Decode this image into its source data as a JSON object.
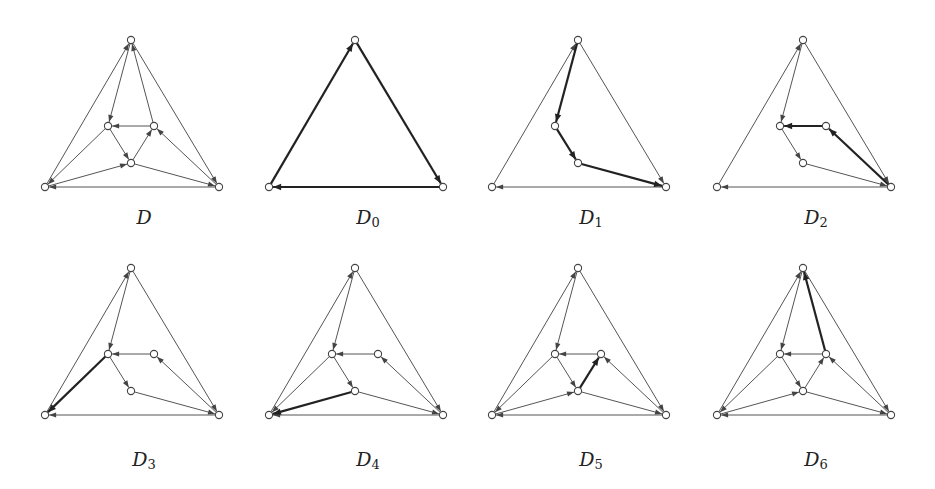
{
  "figure": {
    "nodes": {
      "T": [
        98,
        10
      ],
      "BL": [
        12,
        157
      ],
      "BR": [
        186,
        157
      ],
      "IL": [
        75,
        96
      ],
      "IR": [
        121,
        96
      ],
      "IB": [
        98,
        133
      ]
    },
    "panels": [
      {
        "id": "D",
        "label": "D",
        "subscript": "",
        "x": 33,
        "y": 30,
        "visible_nodes": [
          "T",
          "BL",
          "BR",
          "IL",
          "IR",
          "IB"
        ],
        "edges": [
          {
            "from": "BL",
            "to": "T",
            "thick": false
          },
          {
            "from": "T",
            "to": "BR",
            "thick": false
          },
          {
            "from": "BR",
            "to": "BL",
            "thick": false
          },
          {
            "from": "T",
            "to": "IL",
            "thick": false
          },
          {
            "from": "IR",
            "to": "T",
            "thick": false
          },
          {
            "from": "IR",
            "to": "IL",
            "thick": false
          },
          {
            "from": "IL",
            "to": "IB",
            "thick": false
          },
          {
            "from": "IB",
            "to": "IR",
            "thick": false
          },
          {
            "from": "IL",
            "to": "BL",
            "thick": false
          },
          {
            "from": "BL",
            "to": "IB",
            "thick": false
          },
          {
            "from": "IB",
            "to": "BR",
            "thick": false
          },
          {
            "from": "BR",
            "to": "IR",
            "thick": false
          }
        ]
      },
      {
        "id": "D0",
        "label": "D",
        "subscript": "0",
        "x": 257,
        "y": 30,
        "visible_nodes": [
          "T",
          "BL",
          "BR"
        ],
        "edges": [
          {
            "from": "BL",
            "to": "T",
            "thick": true
          },
          {
            "from": "T",
            "to": "BR",
            "thick": true
          },
          {
            "from": "BR",
            "to": "BL",
            "thick": true
          }
        ]
      },
      {
        "id": "D1",
        "label": "D",
        "subscript": "1",
        "x": 480,
        "y": 30,
        "visible_nodes": [
          "T",
          "BL",
          "BR",
          "IL",
          "IB"
        ],
        "edges": [
          {
            "from": "BL",
            "to": "T",
            "thick": false
          },
          {
            "from": "T",
            "to": "BR",
            "thick": false
          },
          {
            "from": "BR",
            "to": "BL",
            "thick": false
          },
          {
            "from": "T",
            "to": "IL",
            "thick": true
          },
          {
            "from": "IL",
            "to": "IB",
            "thick": true
          },
          {
            "from": "IB",
            "to": "BR",
            "thick": true
          }
        ]
      },
      {
        "id": "D2",
        "label": "D",
        "subscript": "2",
        "x": 705,
        "y": 30,
        "visible_nodes": [
          "T",
          "BL",
          "BR",
          "IL",
          "IR",
          "IB"
        ],
        "edges": [
          {
            "from": "BL",
            "to": "T",
            "thick": false
          },
          {
            "from": "T",
            "to": "BR",
            "thick": false
          },
          {
            "from": "BR",
            "to": "BL",
            "thick": false
          },
          {
            "from": "T",
            "to": "IL",
            "thick": false
          },
          {
            "from": "IL",
            "to": "IB",
            "thick": false
          },
          {
            "from": "IB",
            "to": "BR",
            "thick": false
          },
          {
            "from": "IR",
            "to": "IL",
            "thick": true
          },
          {
            "from": "BR",
            "to": "IR",
            "thick": true
          }
        ]
      },
      {
        "id": "D3",
        "label": "D",
        "subscript": "3",
        "x": 33,
        "y": 258,
        "visible_nodes": [
          "T",
          "BL",
          "BR",
          "IL",
          "IR",
          "IB"
        ],
        "edges": [
          {
            "from": "BL",
            "to": "T",
            "thick": false
          },
          {
            "from": "T",
            "to": "BR",
            "thick": false
          },
          {
            "from": "BR",
            "to": "BL",
            "thick": false
          },
          {
            "from": "T",
            "to": "IL",
            "thick": false
          },
          {
            "from": "IR",
            "to": "IL",
            "thick": false
          },
          {
            "from": "BR",
            "to": "IR",
            "thick": false
          },
          {
            "from": "IL",
            "to": "IB",
            "thick": false
          },
          {
            "from": "IB",
            "to": "BR",
            "thick": false
          },
          {
            "from": "IL",
            "to": "BL",
            "thick": true
          }
        ]
      },
      {
        "id": "D4",
        "label": "D",
        "subscript": "4",
        "x": 257,
        "y": 258,
        "visible_nodes": [
          "T",
          "BL",
          "BR",
          "IL",
          "IR",
          "IB"
        ],
        "edges": [
          {
            "from": "BL",
            "to": "T",
            "thick": false
          },
          {
            "from": "T",
            "to": "BR",
            "thick": false
          },
          {
            "from": "BR",
            "to": "BL",
            "thick": false
          },
          {
            "from": "T",
            "to": "IL",
            "thick": false
          },
          {
            "from": "IR",
            "to": "IL",
            "thick": false
          },
          {
            "from": "BR",
            "to": "IR",
            "thick": false
          },
          {
            "from": "IL",
            "to": "IB",
            "thick": false
          },
          {
            "from": "IB",
            "to": "BR",
            "thick": false
          },
          {
            "from": "IL",
            "to": "BL",
            "thick": false
          },
          {
            "from": "IB",
            "to": "BL",
            "thick": true
          }
        ]
      },
      {
        "id": "D5",
        "label": "D",
        "subscript": "5",
        "x": 480,
        "y": 258,
        "visible_nodes": [
          "T",
          "BL",
          "BR",
          "IL",
          "IR",
          "IB"
        ],
        "edges": [
          {
            "from": "BL",
            "to": "T",
            "thick": false
          },
          {
            "from": "T",
            "to": "BR",
            "thick": false
          },
          {
            "from": "BR",
            "to": "BL",
            "thick": false
          },
          {
            "from": "T",
            "to": "IL",
            "thick": false
          },
          {
            "from": "IR",
            "to": "IL",
            "thick": false
          },
          {
            "from": "BR",
            "to": "IR",
            "thick": false
          },
          {
            "from": "IL",
            "to": "IB",
            "thick": false
          },
          {
            "from": "IB",
            "to": "BR",
            "thick": false
          },
          {
            "from": "IL",
            "to": "BL",
            "thick": false
          },
          {
            "from": "BL",
            "to": "IB",
            "thick": false
          },
          {
            "from": "IB",
            "to": "IR",
            "thick": true
          }
        ]
      },
      {
        "id": "D6",
        "label": "D",
        "subscript": "6",
        "x": 705,
        "y": 258,
        "visible_nodes": [
          "T",
          "BL",
          "BR",
          "IL",
          "IR",
          "IB"
        ],
        "edges": [
          {
            "from": "BL",
            "to": "T",
            "thick": false
          },
          {
            "from": "T",
            "to": "BR",
            "thick": false
          },
          {
            "from": "BR",
            "to": "BL",
            "thick": false
          },
          {
            "from": "T",
            "to": "IL",
            "thick": false
          },
          {
            "from": "IR",
            "to": "IL",
            "thick": false
          },
          {
            "from": "BR",
            "to": "IR",
            "thick": false
          },
          {
            "from": "IL",
            "to": "IB",
            "thick": false
          },
          {
            "from": "IB",
            "to": "BR",
            "thick": false
          },
          {
            "from": "IL",
            "to": "BL",
            "thick": false
          },
          {
            "from": "BL",
            "to": "IB",
            "thick": false
          },
          {
            "from": "IB",
            "to": "IR",
            "thick": false
          },
          {
            "from": "IR",
            "to": "T",
            "thick": true
          }
        ]
      }
    ],
    "captions": {
      "D": "D",
      "D0": "D",
      "D0_sub": "0",
      "D1": "D",
      "D1_sub": "1",
      "D2": "D",
      "D2_sub": "2",
      "D3": "D",
      "D3_sub": "3",
      "D4": "D",
      "D4_sub": "4",
      "D5": "D",
      "D5_sub": "5",
      "D6": "D",
      "D6_sub": "6"
    }
  }
}
